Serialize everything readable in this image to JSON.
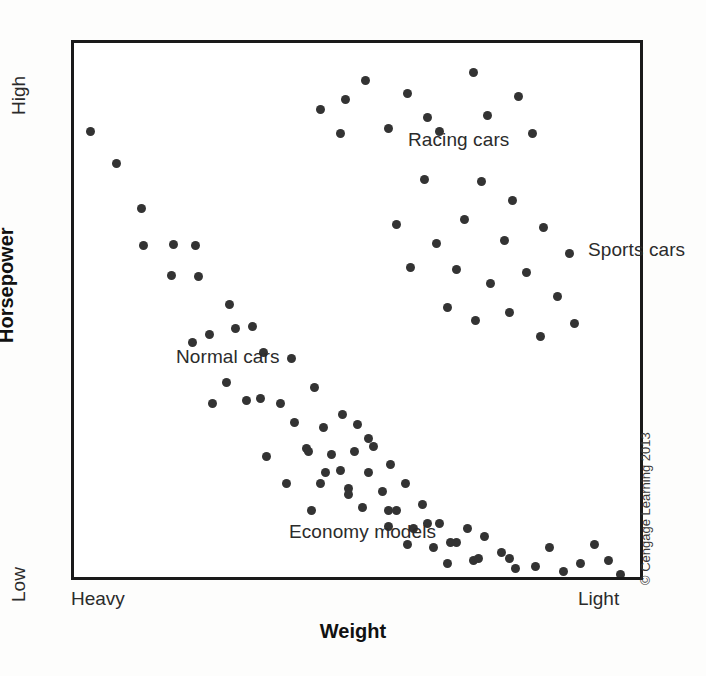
{
  "chart_data": {
    "type": "scatter",
    "title": "",
    "xlabel": "Weight",
    "ylabel": "Horsepower",
    "x_tick_labels": [
      "Heavy",
      "Light"
    ],
    "y_tick_labels": [
      "Low",
      "High"
    ],
    "xlim": [
      0,
      100
    ],
    "ylim": [
      0,
      100
    ],
    "grid": false,
    "legend": "none",
    "annotations": [
      {
        "key": "racing",
        "text": "Racing cars",
        "x": 47,
        "y": 91
      },
      {
        "key": "sports",
        "text": "Sports cars",
        "x": 79,
        "y": 71
      },
      {
        "key": "normal",
        "text": "Normal cars",
        "x": 7,
        "y": 50
      },
      {
        "key": "economy",
        "text": "Economy models",
        "x": 27,
        "y": 18
      }
    ],
    "series": [
      {
        "name": "Normal cars",
        "color": "#333333",
        "points": [
          [
            3.0,
            83.5
          ],
          [
            7.5,
            77.5
          ],
          [
            12.0,
            69.0
          ],
          [
            12.2,
            62.0
          ],
          [
            17.5,
            62.2
          ],
          [
            21.5,
            62.0
          ],
          [
            17.3,
            56.5
          ],
          [
            22.0,
            56.3
          ],
          [
            27.5,
            51.0
          ],
          [
            24.0,
            45.5
          ],
          [
            28.5,
            46.5
          ],
          [
            31.5,
            47.0
          ],
          [
            21.0,
            44.0
          ],
          [
            33.5,
            42.0
          ],
          [
            38.5,
            41.0
          ],
          [
            27.0,
            36.5
          ],
          [
            33.0,
            33.5
          ],
          [
            36.5,
            32.5
          ],
          [
            42.5,
            35.5
          ],
          [
            39.0,
            29.0
          ],
          [
            44.0,
            28.0
          ],
          [
            47.5,
            30.5
          ],
          [
            50.0,
            28.5
          ],
          [
            41.0,
            24.0
          ],
          [
            45.5,
            23.0
          ],
          [
            49.5,
            23.5
          ],
          [
            53.0,
            24.5
          ],
          [
            47.0,
            20.0
          ],
          [
            52.0,
            19.5
          ],
          [
            56.0,
            21.0
          ],
          [
            43.5,
            17.5
          ],
          [
            48.5,
            16.5
          ],
          [
            54.5,
            16.0
          ],
          [
            58.5,
            17.5
          ],
          [
            51.0,
            13.0
          ],
          [
            57.0,
            12.5
          ],
          [
            61.5,
            13.5
          ],
          [
            55.5,
            9.5
          ],
          [
            60.0,
            9.0
          ],
          [
            64.5,
            10.0
          ],
          [
            59.0,
            6.0
          ],
          [
            63.5,
            5.5
          ],
          [
            67.5,
            6.5
          ],
          [
            66.0,
            2.5
          ],
          [
            70.5,
            3.0
          ],
          [
            72.5,
            7.5
          ],
          [
            75.5,
            4.5
          ],
          [
            78.0,
            1.5
          ],
          [
            81.5,
            2.0
          ],
          [
            84.0,
            5.5
          ],
          [
            86.5,
            1.0
          ],
          [
            89.5,
            2.5
          ],
          [
            92.0,
            6.0
          ],
          [
            94.5,
            3.0
          ],
          [
            96.5,
            0.5
          ]
        ]
      },
      {
        "name": "Racing cars",
        "color": "#333333",
        "points": [
          [
            43.5,
            87.5
          ],
          [
            51.5,
            93.0
          ],
          [
            48.0,
            89.5
          ],
          [
            59.0,
            90.5
          ],
          [
            62.5,
            86.0
          ],
          [
            70.5,
            94.5
          ],
          [
            78.5,
            90.0
          ],
          [
            73.0,
            86.5
          ],
          [
            47.0,
            83.0
          ],
          [
            55.5,
            84.0
          ],
          [
            64.5,
            83.5
          ],
          [
            81.0,
            83.0
          ]
        ]
      },
      {
        "name": "Sports cars",
        "color": "#333333",
        "points": [
          [
            62.0,
            74.5
          ],
          [
            72.0,
            74.0
          ],
          [
            77.5,
            70.5
          ],
          [
            69.0,
            67.0
          ],
          [
            57.0,
            66.0
          ],
          [
            64.0,
            62.5
          ],
          [
            76.0,
            63.0
          ],
          [
            83.0,
            65.5
          ],
          [
            87.5,
            60.5
          ],
          [
            59.5,
            58.0
          ],
          [
            67.5,
            57.5
          ],
          [
            73.5,
            55.0
          ],
          [
            80.0,
            57.0
          ],
          [
            85.5,
            52.5
          ],
          [
            66.0,
            50.5
          ],
          [
            71.0,
            48.0
          ],
          [
            77.0,
            49.5
          ],
          [
            82.5,
            45.0
          ],
          [
            88.5,
            47.5
          ]
        ]
      },
      {
        "name": "Economy models",
        "color": "#333333",
        "points": [
          [
            24.5,
            32.5
          ],
          [
            30.5,
            33.0
          ],
          [
            34.0,
            22.5
          ],
          [
            41.5,
            23.5
          ],
          [
            37.5,
            17.5
          ],
          [
            44.5,
            19.5
          ],
          [
            48.5,
            15.5
          ],
          [
            42.0,
            12.5
          ],
          [
            52.0,
            26.0
          ],
          [
            55.5,
            12.5
          ],
          [
            62.5,
            10.0
          ],
          [
            66.5,
            6.5
          ],
          [
            69.5,
            9.0
          ],
          [
            71.5,
            3.5
          ],
          [
            77.0,
            3.5
          ]
        ]
      }
    ]
  },
  "credit": {
    "text": "© Cengage Learning 2013"
  },
  "axes": {
    "x_title": "Weight",
    "y_title": "Horsepower",
    "x_low": "Heavy",
    "x_high": "Light",
    "y_low": "Low",
    "y_high": "High"
  },
  "labels": {
    "racing": "Racing cars",
    "sports": "Sports cars",
    "normal": "Normal cars",
    "economy": "Economy models"
  },
  "colors": {
    "point": "#333333",
    "frame": "#1a1a1a",
    "text": "#2b2b2b",
    "background": "#ffffff"
  }
}
